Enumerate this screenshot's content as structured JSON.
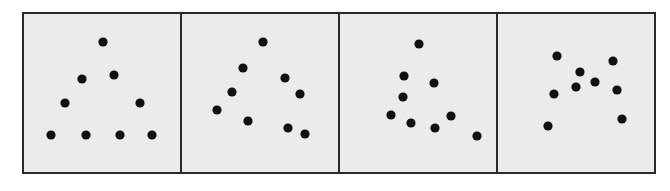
{
  "figure": {
    "colors": {
      "background": "#ebebeb",
      "border": "#2a2a2a",
      "dot": "#111111"
    },
    "dot_radius": 4.6,
    "panel_origin": [
      [
        22,
        12
      ],
      [
        180,
        12
      ],
      [
        339,
        12
      ],
      [
        497,
        12
      ]
    ],
    "panels": [
      {
        "id": "panel-1",
        "pattern": "ordered triangle",
        "dots": [
          [
            103,
            42
          ],
          [
            82,
            79
          ],
          [
            114,
            75
          ],
          [
            65,
            103
          ],
          [
            140,
            103
          ],
          [
            51,
            135
          ],
          [
            86,
            135
          ],
          [
            120,
            135
          ],
          [
            152,
            135
          ]
        ]
      },
      {
        "id": "panel-2",
        "pattern": "slightly disordered triangle",
        "dots": [
          [
            263,
            42
          ],
          [
            243,
            68
          ],
          [
            285,
            78
          ],
          [
            232,
            92
          ],
          [
            300,
            94
          ],
          [
            217,
            110
          ],
          [
            248,
            121
          ],
          [
            288,
            128
          ],
          [
            305,
            134
          ]
        ]
      },
      {
        "id": "panel-3",
        "pattern": "more disordered",
        "dots": [
          [
            419,
            44
          ],
          [
            404,
            76
          ],
          [
            434,
            83
          ],
          [
            403,
            97
          ],
          [
            391,
            115
          ],
          [
            411,
            123
          ],
          [
            435,
            128
          ],
          [
            451,
            116
          ],
          [
            477,
            136
          ]
        ]
      },
      {
        "id": "panel-4",
        "pattern": "random scatter",
        "dots": [
          [
            557,
            56
          ],
          [
            613,
            61
          ],
          [
            580,
            72
          ],
          [
            595,
            82
          ],
          [
            576,
            87
          ],
          [
            554,
            94
          ],
          [
            617,
            90
          ],
          [
            622,
            119
          ],
          [
            548,
            126
          ]
        ]
      }
    ]
  }
}
